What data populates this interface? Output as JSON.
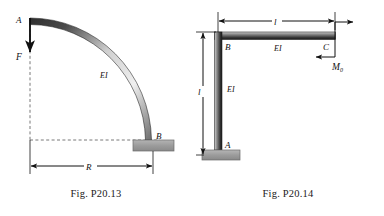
{
  "sheet": {
    "title": "Structural mechanics problem figures",
    "background_color": "#ffffff",
    "ink_color": "#111111"
  },
  "figures": [
    {
      "id": "fig-p20-13",
      "caption": "Fig. P20.13",
      "description": "Quarter-circle curved cantilever beam, fixed at B, vertical downward force F applied at free end A",
      "member_type": "quarter-circular arc",
      "labels": {
        "point_a": "A",
        "point_b": "B",
        "force": "F",
        "stiffness": "EI",
        "radius": "R"
      },
      "dimensions": [
        {
          "name": "R",
          "label": "R",
          "orientation": "horizontal",
          "style": "double-arrow"
        }
      ],
      "loads": [
        {
          "name": "F",
          "label": "F",
          "at": "A",
          "direction": "downward",
          "type": "point-force"
        }
      ],
      "supports": [
        {
          "name": "fixed-support-b",
          "at": "B",
          "type": "fixed",
          "color": "#9a9a9a"
        }
      ],
      "guides": [
        {
          "name": "vertical-dashed-guide",
          "style": "dashed"
        },
        {
          "name": "horizontal-dashed-guide",
          "style": "dashed"
        }
      ]
    },
    {
      "id": "fig-p20-14",
      "caption": "Fig. P20.14",
      "description": "L-shaped frame: vertical column A-B of length l and horizontal beam B-C of length l, fixed at base A, couple M0 applied at free end C",
      "member_type": "L-shaped rigid frame",
      "labels": {
        "point_a": "A",
        "point_b": "B",
        "point_c": "C",
        "moment": "M",
        "moment_subscript": "0",
        "stiffness_column": "EI",
        "stiffness_beam": "EI",
        "length_horizontal": "l",
        "length_vertical": "l"
      },
      "dimensions": [
        {
          "name": "l-horizontal",
          "label": "l",
          "orientation": "horizontal",
          "style": "double-arrow"
        },
        {
          "name": "l-vertical",
          "label": "l",
          "orientation": "vertical",
          "style": "double-arrow"
        }
      ],
      "loads": [
        {
          "name": "M0",
          "label": "M",
          "subscript": "0",
          "at": "C",
          "type": "couple",
          "sense": "counterclockwise"
        }
      ],
      "supports": [
        {
          "name": "fixed-support-a",
          "at": "A",
          "type": "fixed",
          "color": "#9a9a9a"
        }
      ]
    }
  ],
  "colors": {
    "ink": "#111111",
    "member_light": "#f2f2f2",
    "member_mid": "#8c8c8c",
    "member_dark": "#2b2b2b",
    "support_fill": "#9c9c9c",
    "support_stroke": "#6a6a6a",
    "dashed_guide": "#555555"
  }
}
